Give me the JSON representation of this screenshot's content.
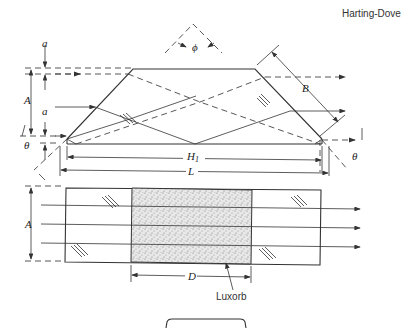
{
  "title": "Harting-Dove",
  "top_view": {
    "labels": {
      "a_top": "a",
      "A": "A",
      "a_mid": "a",
      "theta_left": "θ",
      "theta_right": "θ",
      "phi": "ϕ",
      "B": "B",
      "H1": "H",
      "H1_sub": "1",
      "L": "L"
    }
  },
  "bottom_view": {
    "labels": {
      "A": "A",
      "D": "D",
      "material": "Luxorb"
    }
  }
}
